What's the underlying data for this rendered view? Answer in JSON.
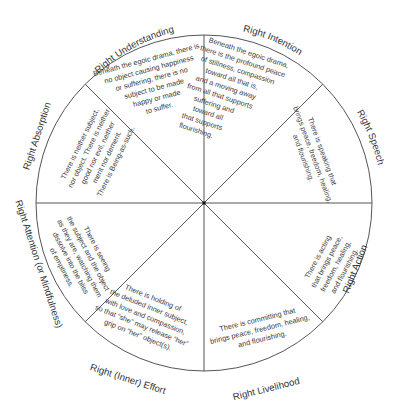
{
  "diagram": {
    "type": "wheel",
    "center": [
      204,
      203
    ],
    "radius": 168,
    "line_color": "#555555",
    "text_color": "#3a3a3a",
    "segments": [
      {
        "label": "Right Understanding",
        "lines": [
          "Beneath the egoic drama, there is",
          "no object causing happiness",
          "or suffering, there is no",
          "subject to be made",
          "happy or made",
          "to suffer."
        ]
      },
      {
        "label": "Right Intention",
        "lines": [
          "Beneath the egoic drama,",
          "there is the profound peace",
          "of stillness, compassion",
          "toward all that is,",
          "and a moving away",
          "from all that supports",
          "suffering and",
          "toward all",
          "that supports",
          "flourishing."
        ]
      },
      {
        "label": "Right Speech",
        "lines": [
          "There is speaking that",
          "brings peace, freedom, healing,",
          "and flourishing."
        ]
      },
      {
        "label": "Right Action",
        "lines": [
          "There is acting",
          "that brings peace,",
          "freedom, healing,",
          "and flourishing."
        ]
      },
      {
        "label": "Right Livelihood",
        "lines": [
          "There is committing that",
          "brings peace, freedom, healing,",
          "and flourishing."
        ]
      },
      {
        "label": "Right (Inner) Effort",
        "lines": [
          "There is holding of",
          "the deluded inner subject,",
          "with love and compassion,",
          "so that “she” may release “her”",
          "grip on “her” object(s)."
        ]
      },
      {
        "label": "Right Attention (or Mindfulness)",
        "lines": [
          "There is seeing",
          "the subject and the object",
          "as they are, watching them",
          "dissolve into the bliss",
          "of emptiness."
        ]
      },
      {
        "label": "Right Absorption",
        "lines": [
          "There is neither subject,",
          "nor object. There is neither",
          "good nor evil, neither",
          "merit nor demerit.",
          "There is Being-as-such."
        ]
      }
    ]
  }
}
